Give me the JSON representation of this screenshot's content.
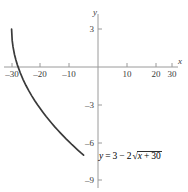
{
  "figure": {
    "title": "",
    "equation_label": {
      "lhs": "y",
      "equals": "=",
      "constant": "3",
      "minus": "−",
      "coefficient": "2",
      "radical_symbol": "√",
      "radicand_var": "x",
      "radicand_plus": "+",
      "radicand_const": "30",
      "full_text": "y = 3 − 2√(x + 30)"
    },
    "axes": {
      "x_axis_name": "x",
      "y_axis_name": "y",
      "x_ticks": [
        "–30",
        "–20",
        "–10",
        "10",
        "20",
        "30"
      ],
      "y_ticks": [
        "3",
        "–3",
        "–6",
        "–9"
      ]
    },
    "colors": {
      "curve": "#3a3a3a",
      "axis": "#9a9a9a",
      "text": "#3b3b3b",
      "background": "#ffffff"
    }
  },
  "chart_data": {
    "type": "line",
    "title": "",
    "subtitle": "",
    "xlabel": "x",
    "ylabel": "y",
    "xlim": [
      -34,
      34
    ],
    "ylim": [
      -9.8,
      4.2
    ],
    "grid": false,
    "legend": false,
    "annotations": [
      {
        "text": "y = 3 − 2√(x + 30)",
        "x": 2,
        "y": -6.6
      }
    ],
    "xticks": [
      -30,
      -20,
      -10,
      10,
      20,
      30
    ],
    "xticklabels": [
      "–30",
      "–20",
      "–10",
      "10",
      "20",
      "30"
    ],
    "yticks": [
      3,
      -3,
      -6,
      -9
    ],
    "yticklabels": [
      "3",
      "–3",
      "–6",
      "–9"
    ],
    "series": [
      {
        "name": "y = 3 - 2*sqrt(x + 30)",
        "equation": "y = 3 - 2*sqrt(x + 30)",
        "domain": [
          -30,
          -5
        ],
        "x": [
          -30.0,
          -29.8,
          -29.5,
          -29.0,
          -28.5,
          -28.0,
          -27.0,
          -26.0,
          -25.0,
          -24.0,
          -23.0,
          -22.0,
          -21.0,
          -20.0,
          -19.0,
          -18.0,
          -17.0,
          -16.0,
          -15.0,
          -14.0,
          -13.0,
          -12.0,
          -11.0,
          -10.0,
          -9.0,
          -8.0,
          -7.0,
          -6.0,
          -5.0
        ],
        "y": [
          3.0,
          2.11,
          1.59,
          0.99,
          0.55,
          0.17,
          -0.46,
          -1.0,
          -1.47,
          -1.9,
          -2.29,
          -2.66,
          -3.0,
          -3.32,
          -3.63,
          -3.93,
          -4.21,
          -4.48,
          -4.75,
          -5.0,
          -5.25,
          -5.49,
          -5.72,
          -5.94,
          -6.17,
          -6.38,
          -6.59,
          -6.8,
          -7.0
        ]
      }
    ]
  }
}
